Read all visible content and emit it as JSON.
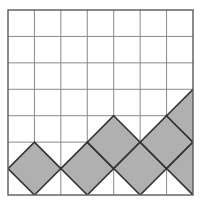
{
  "figure": {
    "canvas": {
      "width": 202,
      "height": 207,
      "background": "#ffffff"
    },
    "grid": {
      "x0": 8,
      "y0": 10,
      "x1": 193,
      "y1": 195,
      "columns": 7,
      "rows": 7,
      "cell_size": 26.43,
      "line_color": "#8a8a8a",
      "line_width": 1,
      "border_color": "#5a5a5a",
      "border_width": 1.4,
      "show_grid": true
    },
    "shapes": {
      "kind": "rotated-square",
      "rotation_degrees": 45,
      "fill_color": "#b0b0b0",
      "stroke_color": "#333333",
      "stroke_width": 1.6,
      "half_diagonal_cells": 1,
      "clip_to_grid": true,
      "count": 7,
      "description": "Each shaded square is a 45-degree rotated square whose diagonal spans two grid cells; centers sit on grid lattice points and rise stepwise to the right.",
      "centers_in_cells": [
        {
          "cx": 1,
          "cy": 6,
          "label": "diamond-1"
        },
        {
          "cx": 3,
          "cy": 6,
          "label": "diamond-2"
        },
        {
          "cx": 4,
          "cy": 5,
          "label": "diamond-3"
        },
        {
          "cx": 5,
          "cy": 6,
          "label": "diamond-4"
        },
        {
          "cx": 6,
          "cy": 5,
          "label": "diamond-5"
        },
        {
          "cx": 7,
          "cy": 6,
          "label": "diamond-6"
        },
        {
          "cx": 7,
          "cy": 4,
          "label": "diamond-7"
        }
      ]
    }
  },
  "chart_data": {
    "type": "scatter",
    "title": "",
    "xlabel": "",
    "ylabel": "",
    "xlim": [
      0,
      7
    ],
    "ylim": [
      0,
      7
    ],
    "grid": true,
    "legend": "none",
    "marker": "rotated-square",
    "marker_fill": "#b0b0b0",
    "marker_edge": "#333333",
    "x": [
      1,
      3,
      4,
      5,
      6,
      7,
      7
    ],
    "y": [
      1,
      1,
      2,
      1,
      2,
      1,
      3
    ],
    "categories": [
      "diamond-1",
      "diamond-2",
      "diamond-3",
      "diamond-4",
      "diamond-5",
      "diamond-6",
      "diamond-7"
    ],
    "values": [
      1,
      1,
      2,
      1,
      2,
      1,
      3
    ]
  }
}
